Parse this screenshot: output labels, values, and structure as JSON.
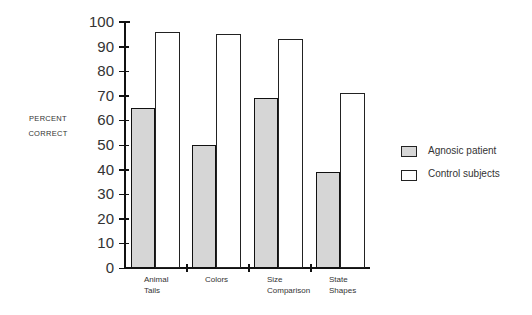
{
  "chart_data": {
    "type": "bar",
    "title": "",
    "xlabel": "",
    "ylabel": "PERCENT CORRECT",
    "ylabel_lines": [
      "PERCENT",
      "CORRECT"
    ],
    "ylim": [
      0,
      100
    ],
    "yticks": [
      0,
      10,
      20,
      30,
      40,
      50,
      60,
      70,
      80,
      90,
      100
    ],
    "grid": false,
    "legend_position": "right",
    "categories": [
      "Animal Tails",
      "Colors",
      "Size Comparison",
      "State Shapes"
    ],
    "category_lines": [
      [
        "Animal",
        "Tails"
      ],
      [
        "Colors"
      ],
      [
        "Size",
        "Comparison"
      ],
      [
        "State",
        "Shapes"
      ]
    ],
    "series": [
      {
        "name": "Agnosic patient",
        "fill": "stippled gray",
        "values": [
          65,
          50,
          69,
          39
        ]
      },
      {
        "name": "Control subjects",
        "fill": "white",
        "values": [
          96,
          95,
          93,
          71
        ]
      }
    ]
  },
  "legend": [
    {
      "label": "Agnosic patient"
    },
    {
      "label": "Control subjects"
    }
  ]
}
